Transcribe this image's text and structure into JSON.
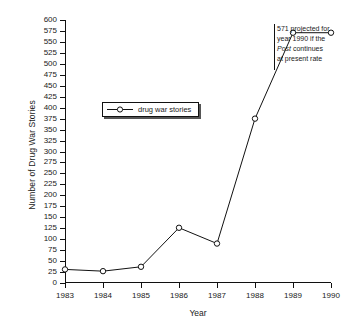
{
  "chart_data": {
    "type": "line",
    "title": "",
    "xlabel": "Year",
    "ylabel": "Number of Drug War Stories",
    "categories": [
      "1983",
      "1984",
      "1985",
      "1986",
      "1987",
      "1988",
      "1989",
      "1990"
    ],
    "x": [
      1983,
      1984,
      1985,
      1986,
      1987,
      1988,
      1989,
      1990
    ],
    "values": [
      31,
      27,
      37,
      126,
      90,
      375,
      571,
      571
    ],
    "series": [
      {
        "name": "drug war stories",
        "values": [
          31,
          27,
          37,
          126,
          90,
          375,
          571,
          571
        ]
      }
    ],
    "xlim": [
      1983,
      1990
    ],
    "ylim": [
      0,
      600
    ],
    "ytick_labels": [
      "0",
      "25",
      "50",
      "75",
      "100",
      "125",
      "150",
      "175",
      "200",
      "225",
      "250",
      "275",
      "300",
      "325",
      "350",
      "375",
      "400",
      "425",
      "450",
      "475",
      "500",
      "525",
      "550",
      "575",
      "600"
    ],
    "ytick_values": [
      0,
      25,
      50,
      75,
      100,
      125,
      150,
      175,
      200,
      225,
      250,
      275,
      300,
      325,
      350,
      375,
      400,
      425,
      450,
      475,
      500,
      525,
      550,
      575,
      600
    ],
    "xtick_labels": [
      "1983",
      "1984",
      "1985",
      "1986",
      "1987",
      "1988",
      "1989",
      "1990"
    ],
    "grid": false,
    "legend": {
      "position": "inside-upper-left",
      "entries": [
        "drug war stories"
      ]
    },
    "marker": "open-circle",
    "line_color": "#111111",
    "marker_fill": "#ffffff",
    "annotations": [
      {
        "text_lines": [
          "571 projected for",
          "year 1990 if the",
          "Post continues",
          "at present rate"
        ],
        "italic_word": "Post",
        "target_value": 571,
        "target_year": 1990
      }
    ]
  },
  "legend": {
    "label": "drug war stories"
  },
  "annotation": {
    "line1": "571 projected for",
    "line2": "year 1990 if the",
    "line3_em": "Post",
    "line3_rest": " continues",
    "line4": "at present rate"
  },
  "axes": {
    "xlabel": "Year",
    "ylabel": "Number of Drug War Stories"
  }
}
